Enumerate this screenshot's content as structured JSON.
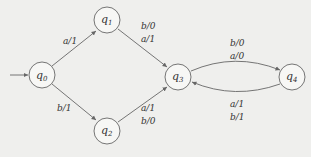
{
  "diagram": {
    "type": "finite-state-machine (Mealy)",
    "states": [
      {
        "id": "q0",
        "label": "q",
        "sub": "0",
        "initial": true
      },
      {
        "id": "q1",
        "label": "q",
        "sub": "1"
      },
      {
        "id": "q2",
        "label": "q",
        "sub": "2"
      },
      {
        "id": "q3",
        "label": "q",
        "sub": "3"
      },
      {
        "id": "q4",
        "label": "q",
        "sub": "4"
      }
    ],
    "transitions": [
      {
        "from": "q0",
        "to": "q1",
        "labels": [
          "a/1"
        ]
      },
      {
        "from": "q0",
        "to": "q2",
        "labels": [
          "b/1"
        ]
      },
      {
        "from": "q1",
        "to": "q3",
        "labels": [
          "b/0",
          "a/1"
        ]
      },
      {
        "from": "q2",
        "to": "q3",
        "labels": [
          "a/1",
          "b/0"
        ]
      },
      {
        "from": "q3",
        "to": "q4",
        "labels": [
          "b/0",
          "a/0"
        ]
      },
      {
        "from": "q4",
        "to": "q3",
        "labels": [
          "a/1",
          "b/1"
        ]
      }
    ]
  },
  "labels": {
    "e01": "a/1",
    "e02": "b/1",
    "e13a": "b/0",
    "e13b": "a/1",
    "e23a": "a/1",
    "e23b": "b/0",
    "e34a": "b/0",
    "e34b": "a/0",
    "e43a": "a/1",
    "e43b": "b/1"
  }
}
